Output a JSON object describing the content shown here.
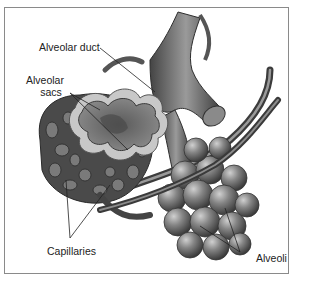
{
  "figure": {
    "labels": {
      "alveolar_duct": "Alveolar duct",
      "alveolar_sacs_line1": "Alveolar",
      "alveolar_sacs_line2": "sacs",
      "capillaries": "Capillaries",
      "alveoli": "Alveoli"
    },
    "colors": {
      "background": "#ffffff",
      "frame": "#8a8a8a",
      "tissue_dark": "#3a3a3a",
      "tissue_mid": "#6f6f6f",
      "tissue_light": "#a8a8a8",
      "highlight": "#d8d8d8",
      "text": "#222222"
    }
  }
}
